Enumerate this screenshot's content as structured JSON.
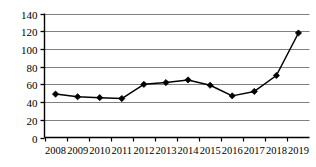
{
  "chart_data": {
    "type": "line",
    "title": "",
    "subtitle": "",
    "xlabel": "",
    "ylabel": "",
    "categories": [
      "2008",
      "2009",
      "2010",
      "2011",
      "2012",
      "2013",
      "2014",
      "2015",
      "2016",
      "2017",
      "2018",
      "2019"
    ],
    "values": [
      49,
      46,
      45,
      44,
      60,
      62,
      65,
      59,
      47,
      52,
      70,
      118
    ],
    "series": [
      {
        "name": "",
        "values": [
          49,
          46,
          45,
          44,
          60,
          62,
          65,
          59,
          47,
          52,
          70,
          118
        ]
      }
    ],
    "ylim": [
      0,
      140
    ],
    "yticks": [
      0,
      20,
      40,
      60,
      80,
      100,
      120,
      140
    ],
    "ytick_labels": [
      "0",
      "20",
      "40",
      "60",
      "80",
      "100",
      "120",
      "140"
    ],
    "xtick_labels": [
      "2008",
      "2009",
      "2010",
      "2011",
      "2012",
      "2013",
      "2014",
      "2015",
      "2016",
      "2017",
      "2018",
      "2019"
    ],
    "grid": "horizontal",
    "legend": "none",
    "marker": "diamond",
    "line_color": "#000000",
    "marker_color": "#000000",
    "grid_color": "#808080",
    "axis_color": "#000000",
    "background_color": "#ffffff",
    "annotations": []
  }
}
